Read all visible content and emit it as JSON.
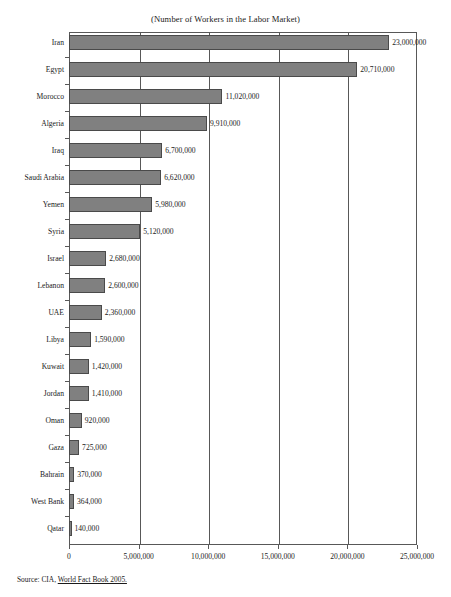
{
  "chart_data": {
    "type": "bar",
    "orientation": "horizontal",
    "title": "(Number of Workers in the Labor Market)",
    "xlabel": "",
    "ylabel": "",
    "xlim": [
      0,
      25000000
    ],
    "xticks": [
      0,
      5000000,
      10000000,
      15000000,
      20000000,
      25000000
    ],
    "xtick_labels": [
      "0",
      "5,000,000",
      "10,000,000",
      "15,000,000",
      "20,000,000",
      "25,000,000"
    ],
    "grid": true,
    "legend": null,
    "bar_color": "#808080",
    "bar_edge_color": "#4a4a4a",
    "categories": [
      "Iran",
      "Egypt",
      "Morocco",
      "Algeria",
      "Iraq",
      "Saudi Arabia",
      "Yemen",
      "Syria",
      "Israel",
      "Lebanon",
      "UAE",
      "Libya",
      "Kuwait",
      "Jordan",
      "Oman",
      "Gaza",
      "Bahrain",
      "West Bank",
      "Qatar"
    ],
    "values": [
      23000000,
      20710000,
      11020000,
      9910000,
      6700000,
      6620000,
      5980000,
      5120000,
      2680000,
      2600000,
      2360000,
      1590000,
      1420000,
      1410000,
      920000,
      725000,
      370000,
      364000,
      140000
    ],
    "value_labels": [
      "23,000,000",
      "20,710,000",
      "11,020,000",
      "9,910,000",
      "6,700,000",
      "6,620,000",
      "5,980,000",
      "5,120,000",
      "2,680,000",
      "2,600,000",
      "2,360,000",
      "1,590,000",
      "1,420,000",
      "1,410,000",
      "920,000",
      "725,000",
      "370,000",
      "364,000",
      "140,000"
    ]
  },
  "source": {
    "prefix": "Source: CIA, ",
    "publication": "World Fact Book 2005."
  }
}
